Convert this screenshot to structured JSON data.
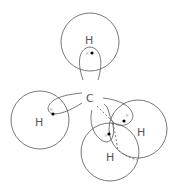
{
  "diagram": {
    "center_atom": {
      "label": "C",
      "x": 90,
      "y": 98
    },
    "hydrogens": [
      {
        "label": "H",
        "x": 89,
        "y": 40
      },
      {
        "label": "H",
        "x": 40,
        "y": 123
      },
      {
        "label": "H",
        "x": 141,
        "y": 132
      },
      {
        "label": "H",
        "x": 110,
        "y": 157
      }
    ],
    "electron_marks": {
      "dot": "•",
      "cross": "×"
    },
    "colors": {
      "stroke": "#555555",
      "text": "#555555",
      "background": "#ffffff"
    }
  }
}
